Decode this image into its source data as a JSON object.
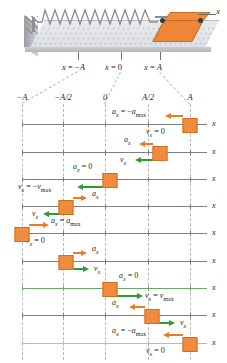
{
  "figure": {
    "apparatus": {
      "axis_label": "x",
      "position_ticks": [
        {
          "label_html": "x = −A",
          "x": 78
        },
        {
          "label_html": "x = 0",
          "x": 121
        },
        {
          "label_html": "x = A",
          "x": 160
        }
      ]
    },
    "columns": [
      {
        "label": "−A",
        "x": 22
      },
      {
        "label": "−A/2",
        "x": 63
      },
      {
        "label": "0",
        "x": 105
      },
      {
        "label": "A/2",
        "x": 148
      },
      {
        "label": "A",
        "x": 190
      }
    ],
    "axis_label": "x",
    "colors": {
      "block_fill": "#ef8c3e",
      "block_border": "#cf6f22",
      "acceleration_arrow": "#ef7a25",
      "velocity_arrow": "#2e9b35",
      "axis_line": "#7b7e82",
      "gridline": "#b6b9bd",
      "highlight_line": "#f2a0a0"
    },
    "panels": [
      {
        "name": "panel-1",
        "y": 124,
        "block_x": 190,
        "line_tint": "#7b7e82",
        "accel": {
          "label_html": "a<sub>x</sub> = −a<sub>max</sub>",
          "dir": "left",
          "length": 18,
          "label_x": 112,
          "label_y": -16,
          "arrow_from": 183
        },
        "vel": {
          "label_html": "v<sub>x</sub> = 0",
          "dir": "none",
          "length": 0,
          "label_x": 146,
          "label_y": 4,
          "arrow_from": 183
        }
      },
      {
        "name": "panel-2",
        "y": 152,
        "block_x": 160,
        "line_tint": "#7b7e82",
        "accel": {
          "label_html": "a<sub>x</sub>",
          "dir": "left",
          "length": 14,
          "label_x": 124,
          "label_y": -16,
          "arrow_from": 153
        },
        "vel": {
          "label_html": "v<sub>x</sub>",
          "dir": "left",
          "length": 18,
          "label_x": 120,
          "label_y": 4,
          "arrow_from": 153
        }
      },
      {
        "name": "panel-3",
        "y": 179,
        "block_x": 110,
        "line_tint": "#7b7e82",
        "accel": {
          "label_html": "a<sub>x</sub> = 0",
          "dir": "none",
          "length": 0,
          "label_x": 73,
          "label_y": -16,
          "arrow_from": 103
        },
        "vel": {
          "label_html": "v<sub>x</sub> = −v<sub>max</sub>",
          "dir": "left",
          "length": 26,
          "label_x": 18,
          "label_y": 4,
          "arrow_from": 103
        }
      },
      {
        "name": "panel-4",
        "y": 206,
        "block_x": 66,
        "line_tint": "#7b7e82",
        "accel": {
          "label_html": "a<sub>x</sub>",
          "dir": "right",
          "length": 14,
          "label_x": 92,
          "label_y": -16,
          "arrow_from": 73
        },
        "vel": {
          "label_html": "v<sub>x</sub>",
          "dir": "left",
          "length": 16,
          "label_x": 32,
          "label_y": 4,
          "arrow_from": 59
        }
      },
      {
        "name": "panel-5",
        "y": 233,
        "block_x": 22,
        "line_tint": "#7b7e82",
        "accel": {
          "label_html": "a<sub>x</sub> = a<sub>max</sub>",
          "dir": "right",
          "length": 20,
          "label_x": 51,
          "label_y": -16,
          "arrow_from": 29
        },
        "vel": {
          "label_html": "v<sub>x</sub> = 0",
          "dir": "none",
          "length": 0,
          "label_x": 26,
          "label_y": 4,
          "arrow_from": 29
        }
      },
      {
        "name": "panel-6",
        "y": 261,
        "block_x": 66,
        "line_tint": "#7b7e82",
        "accel": {
          "label_html": "a<sub>x</sub>",
          "dir": "right",
          "length": 14,
          "label_x": 92,
          "label_y": -16,
          "arrow_from": 73
        },
        "vel": {
          "label_html": "v<sub>x</sub>",
          "dir": "right",
          "length": 16,
          "label_x": 94,
          "label_y": 4,
          "arrow_from": 73
        }
      },
      {
        "name": "panel-7",
        "y": 288,
        "block_x": 110,
        "line_tint": "#69a96a",
        "accel": {
          "label_html": "a<sub>x</sub> = 0",
          "dir": "none",
          "length": 0,
          "label_x": 119,
          "label_y": -16,
          "arrow_from": 117
        },
        "vel": {
          "label_html": "v<sub>x</sub> = v<sub>max</sub>",
          "dir": "right",
          "length": 26,
          "label_x": 145,
          "label_y": 4,
          "arrow_from": 117
        }
      },
      {
        "name": "panel-8",
        "y": 315,
        "block_x": 152,
        "line_tint": "#7b7e82",
        "accel": {
          "label_html": "a<sub>x</sub>",
          "dir": "left",
          "length": 16,
          "label_x": 112,
          "label_y": -16,
          "arrow_from": 145
        },
        "vel": {
          "label_html": "v<sub>x</sub>",
          "dir": "right",
          "length": 16,
          "label_x": 180,
          "label_y": 4,
          "arrow_from": 159
        }
      },
      {
        "name": "panel-9",
        "y": 343,
        "block_x": 190,
        "line_tint": "#f2a0a0",
        "accel": {
          "label_html": "a<sub>x</sub> = −a<sub>max</sub>",
          "dir": "left",
          "length": 20,
          "label_x": 112,
          "label_y": -16,
          "arrow_from": 183
        },
        "vel": {
          "label_html": "v<sub>x</sub> = 0",
          "dir": "none",
          "length": 0,
          "label_x": 146,
          "label_y": 4,
          "arrow_from": 183
        }
      }
    ]
  }
}
